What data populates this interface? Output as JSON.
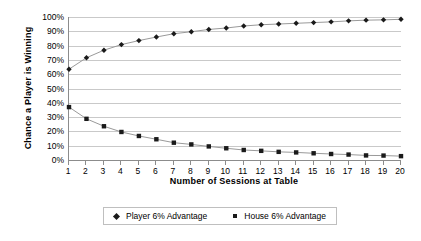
{
  "chart_data": {
    "type": "line",
    "title": "",
    "xlabel": "Number of Sessions at Table",
    "ylabel": "Chance a Player is Winning",
    "x": [
      1,
      2,
      3,
      4,
      5,
      6,
      7,
      8,
      9,
      10,
      11,
      12,
      13,
      14,
      15,
      16,
      17,
      18,
      19,
      20
    ],
    "xlim": [
      1,
      20
    ],
    "ylim": [
      0,
      100
    ],
    "grid": true,
    "legend_position": "bottom",
    "y_tick_labels": [
      "100%",
      "90%",
      "80%",
      "70%",
      "60%",
      "50%",
      "40%",
      "30%",
      "20%",
      "10%",
      "0%"
    ],
    "y_tick_values": [
      100,
      90,
      80,
      70,
      60,
      50,
      40,
      30,
      20,
      10,
      0
    ],
    "x_tick_labels": [
      "1",
      "2",
      "3",
      "4",
      "5",
      "6",
      "7",
      "8",
      "9",
      "10",
      "11",
      "12",
      "13",
      "14",
      "15",
      "16",
      "17",
      "18",
      "19",
      "20"
    ],
    "series": [
      {
        "name": "Player 6% Advantage",
        "marker": "diamond",
        "color": "#1a1a1a",
        "values": [
          63.5,
          71.5,
          76.8,
          80.7,
          83.5,
          86.0,
          88.3,
          89.7,
          91.3,
          92.3,
          93.7,
          94.6,
          95.1,
          95.6,
          96.1,
          96.6,
          97.3,
          97.8,
          98.0,
          98.4
        ]
      },
      {
        "name": "House 6% Advantage",
        "marker": "square",
        "color": "#1a1a1a",
        "values": [
          37.0,
          28.8,
          23.6,
          19.6,
          16.8,
          14.5,
          12.1,
          10.9,
          9.5,
          8.2,
          7.0,
          6.4,
          5.7,
          5.3,
          4.7,
          4.2,
          3.8,
          3.2,
          3.1,
          2.7
        ]
      }
    ]
  },
  "axis": {
    "y_title": "Chance a Player is Winning",
    "x_title": "Number of Sessions at Table"
  },
  "legend": {
    "entries": [
      {
        "label": "Player 6% Advantage",
        "marker": "diamond"
      },
      {
        "label": "House 6% Advantage",
        "marker": "square"
      }
    ]
  },
  "colors": {
    "series_marker": "#1a1a1a",
    "line": "#9a9a9a",
    "gridline": "#c9c9c9",
    "axis": "#8c8c8c",
    "legend_border": "#bfbfbf",
    "background": "#ffffff"
  }
}
